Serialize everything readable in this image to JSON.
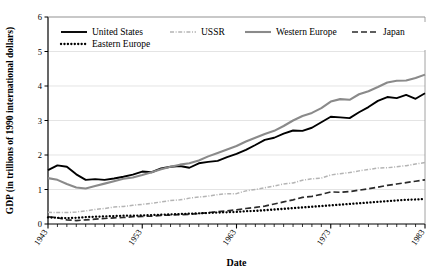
{
  "chart_data": {
    "type": "line",
    "title": "",
    "xlabel": "Date",
    "ylabel": "GDP (in trillions of 1990 international dollars)",
    "xlim": [
      1943,
      1983
    ],
    "ylim": [
      0,
      6
    ],
    "ytick_labels": [
      "0",
      "1",
      "2",
      "3",
      "4",
      "5",
      "6"
    ],
    "ytick_values": [
      0,
      1,
      2,
      3,
      4,
      5,
      6
    ],
    "xtick_labels": [
      "1943",
      "1953",
      "1963",
      "1973",
      "1983"
    ],
    "xtick_values": [
      1943,
      1953,
      1963,
      1973,
      1983
    ],
    "xtick_minor_step": 1,
    "grid": "horizontal",
    "legend_position": "top-left-inside",
    "x": [
      1943,
      1944,
      1945,
      1946,
      1947,
      1948,
      1949,
      1950,
      1951,
      1952,
      1953,
      1954,
      1955,
      1956,
      1957,
      1958,
      1959,
      1960,
      1961,
      1962,
      1963,
      1964,
      1965,
      1966,
      1967,
      1968,
      1969,
      1970,
      1971,
      1972,
      1973,
      1974,
      1975,
      1976,
      1977,
      1978,
      1979,
      1980,
      1981,
      1982,
      1983
    ],
    "series": [
      {
        "name": "United States",
        "color": "#000000",
        "style": "solid",
        "width": 1.9,
        "values": [
          1.56,
          1.7,
          1.66,
          1.44,
          1.28,
          1.3,
          1.28,
          1.32,
          1.37,
          1.43,
          1.52,
          1.5,
          1.61,
          1.66,
          1.68,
          1.63,
          1.76,
          1.8,
          1.83,
          1.94,
          2.03,
          2.15,
          2.29,
          2.44,
          2.5,
          2.62,
          2.71,
          2.7,
          2.79,
          2.95,
          3.11,
          3.09,
          3.07,
          3.24,
          3.39,
          3.57,
          3.68,
          3.65,
          3.74,
          3.63,
          3.79
        ]
      },
      {
        "name": "USSR",
        "color": "#b4b4b4",
        "style": "dashdot",
        "width": 1.5,
        "values": [
          0.34,
          0.33,
          0.33,
          0.35,
          0.38,
          0.42,
          0.45,
          0.49,
          0.51,
          0.54,
          0.57,
          0.6,
          0.64,
          0.68,
          0.7,
          0.75,
          0.78,
          0.81,
          0.85,
          0.88,
          0.88,
          0.96,
          1.0,
          1.05,
          1.1,
          1.16,
          1.19,
          1.27,
          1.31,
          1.33,
          1.42,
          1.46,
          1.49,
          1.54,
          1.58,
          1.62,
          1.63,
          1.66,
          1.69,
          1.74,
          1.78
        ]
      },
      {
        "name": "Western Europe",
        "color": "#8a8a8a",
        "style": "solid",
        "width": 2.1,
        "values": [
          1.33,
          1.28,
          1.16,
          1.06,
          1.03,
          1.1,
          1.17,
          1.24,
          1.31,
          1.35,
          1.42,
          1.5,
          1.59,
          1.66,
          1.72,
          1.76,
          1.84,
          1.96,
          2.06,
          2.16,
          2.26,
          2.39,
          2.5,
          2.61,
          2.7,
          2.84,
          3.0,
          3.13,
          3.22,
          3.36,
          3.55,
          3.62,
          3.6,
          3.76,
          3.85,
          3.97,
          4.1,
          4.15,
          4.16,
          4.23,
          4.33
        ]
      },
      {
        "name": "Japan",
        "color": "#2a2a2a",
        "style": "dashed",
        "width": 1.7,
        "values": [
          0.21,
          0.18,
          0.12,
          0.1,
          0.12,
          0.14,
          0.16,
          0.18,
          0.19,
          0.21,
          0.22,
          0.23,
          0.25,
          0.26,
          0.27,
          0.28,
          0.3,
          0.33,
          0.36,
          0.38,
          0.41,
          0.45,
          0.48,
          0.52,
          0.58,
          0.64,
          0.7,
          0.77,
          0.8,
          0.86,
          0.93,
          0.92,
          0.94,
          0.98,
          1.02,
          1.07,
          1.12,
          1.16,
          1.2,
          1.24,
          1.28
        ]
      },
      {
        "name": "Eastern Europe",
        "color": "#000000",
        "style": "dotted",
        "width": 2.3,
        "values": [
          0.19,
          0.18,
          0.17,
          0.18,
          0.2,
          0.21,
          0.22,
          0.23,
          0.24,
          0.24,
          0.25,
          0.26,
          0.27,
          0.28,
          0.29,
          0.3,
          0.31,
          0.32,
          0.33,
          0.34,
          0.35,
          0.37,
          0.38,
          0.4,
          0.42,
          0.44,
          0.46,
          0.48,
          0.5,
          0.52,
          0.54,
          0.56,
          0.58,
          0.6,
          0.62,
          0.64,
          0.66,
          0.68,
          0.7,
          0.71,
          0.73
        ]
      }
    ]
  },
  "legend": {
    "items": [
      {
        "label": "United States"
      },
      {
        "label": "USSR"
      },
      {
        "label": "Western Europe"
      },
      {
        "label": "Japan"
      },
      {
        "label": "Eastern Europe"
      }
    ]
  },
  "axes": {
    "y_title": "GDP (in trillions of 1990 international dollars)",
    "x_title": "Date"
  }
}
